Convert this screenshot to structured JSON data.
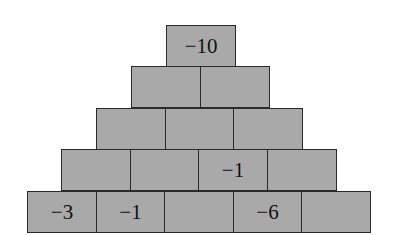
{
  "pyramid": {
    "rows": [
      [
        "-10"
      ],
      [
        "",
        ""
      ],
      [
        "",
        "",
        ""
      ],
      [
        "",
        "",
        "-1",
        ""
      ],
      [
        "-3",
        "-1",
        "",
        "-6",
        ""
      ]
    ],
    "display": {
      "r0c0": "−10",
      "r3c2": "−1",
      "r4c0": "−3",
      "r4c1": "−1",
      "r4c3": "−6"
    },
    "cell_color": "#a9a9a9",
    "border_color": "#2a2a2a"
  }
}
